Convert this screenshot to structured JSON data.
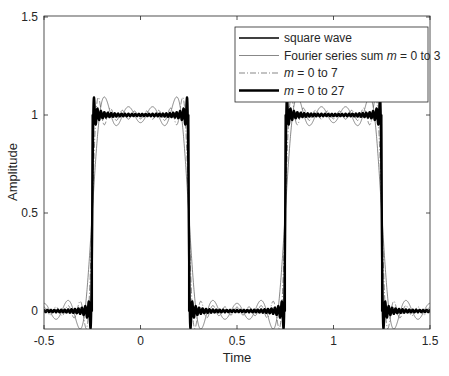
{
  "chart_data": {
    "type": "line",
    "title": "",
    "xlabel": "Time",
    "ylabel": "Amplitude",
    "xlim": [
      -0.5,
      1.5
    ],
    "ylim": [
      -0.05,
      1.5
    ],
    "xticks": [
      -0.5,
      0,
      0.5,
      1,
      1.5
    ],
    "xtick_labels": [
      "-0.5",
      "0",
      "0.5",
      "1",
      "1.5"
    ],
    "yticks": [
      0,
      0.5,
      1,
      1.5
    ],
    "ytick_labels": [
      "0",
      "0.5",
      "1",
      "1.5"
    ],
    "grid": false,
    "legend_position": "upper right",
    "signal": {
      "description": "Square wave with period 1, value 1 on |t| mod 1 in [0.75, 1.25] style (high from 0.75 to 1.25 and -0.25 to 0.25), 0 otherwise; Fourier partial sums of odd harmonics",
      "period": 1,
      "high_intervals": [
        [
          -0.25,
          0.25
        ],
        [
          0.75,
          1.25
        ]
      ],
      "low_value": 0,
      "high_value": 1
    },
    "series": [
      {
        "name": "square wave",
        "style": "solid",
        "width": 1.6,
        "color": "#000000",
        "kind": "square",
        "terms": null
      },
      {
        "name": "Fourier series sum m = 0 to 3",
        "style": "solid",
        "width": 0.7,
        "color": "#555555",
        "kind": "fourier",
        "terms": 3
      },
      {
        "name": "m = 0 to 7",
        "style": "dashdot",
        "width": 0.7,
        "color": "#555555",
        "kind": "fourier",
        "terms": 7
      },
      {
        "name": "m = 0 to 27",
        "style": "solid",
        "width": 2.4,
        "color": "#000000",
        "kind": "fourier",
        "terms": 27
      }
    ]
  },
  "legend": {
    "entries": [
      {
        "prefix": "square wave",
        "italic": "",
        "suffix": ""
      },
      {
        "prefix": "Fourier series sum ",
        "italic": "m",
        "suffix": " = 0 to 3"
      },
      {
        "prefix": "",
        "italic": "m",
        "suffix": " = 0 to 7"
      },
      {
        "prefix": "",
        "italic": "m",
        "suffix": " = 0 to 27"
      }
    ]
  },
  "colors": {
    "axis": "#262626",
    "text": "#262626",
    "background": "#ffffff"
  }
}
